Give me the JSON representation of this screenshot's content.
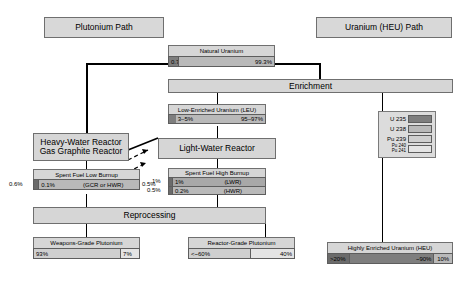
{
  "diagram": {
    "title_plutonium": "Plutonium Path",
    "title_uranium": "Uranium (HEU) Path",
    "nodes": {
      "natural_uranium": {
        "label": "Natural Uranium",
        "segments": [
          {
            "value": "0.7%",
            "isotope": "U 235"
          },
          {
            "value": "99.3%",
            "isotope": "U 238"
          }
        ]
      },
      "enrichment": {
        "label": "Enrichment"
      },
      "leu": {
        "label": "Low-Enriched Uranium (LEU)",
        "segments": [
          {
            "value": "3–5%",
            "isotope": "U 235"
          },
          {
            "value": "95–97%",
            "isotope": "U 238"
          }
        ]
      },
      "heavy_water_reactor": {
        "line1": "Heavy-Water Reactor",
        "line2": "Gas Graphite Reactor"
      },
      "light_water_reactor": {
        "label": "Light-Water Reactor"
      },
      "spent_fuel_low": {
        "label": "Spent Fuel Low Burnup",
        "sublabel": "(GCR or HWR)",
        "outside_left": "0.6%",
        "outside_right": "0.5%",
        "segments": [
          {
            "value": "0.1%",
            "isotope": "U 235"
          }
        ]
      },
      "spent_fuel_high": {
        "label": "Spent Fuel High Burnup",
        "row1_label": "(LWR)",
        "row1_value": "1%",
        "row1_outside": "1%",
        "row2_label": "(HWR)",
        "row2_value": "0.2%",
        "row2_outside": "0.5%"
      },
      "reprocessing": {
        "label": "Reprocessing"
      },
      "weapons_grade_plutonium": {
        "label": "Weapons-Grade Plutonium",
        "segments": [
          {
            "value": "93%",
            "isotope": "Pu 239"
          },
          {
            "value": "7%",
            "isotope": "Pu 240/241"
          }
        ]
      },
      "reactor_grade_plutonium": {
        "label": "Reactor-Grade Plutonium",
        "segments": [
          {
            "value": "<~60%",
            "isotope": "Pu 239"
          },
          {
            "value": "40%",
            "isotope": "Pu 240/241"
          }
        ]
      },
      "heu": {
        "label": "Highly Enriched Uranium (HEU)",
        "segments": [
          {
            "value": ">20%",
            "isotope": "U 235 min"
          },
          {
            "value": "~90%",
            "isotope": "U 235"
          },
          {
            "value": "10%",
            "isotope": "U 238"
          }
        ]
      }
    },
    "legend": {
      "items": [
        {
          "label": "U 235",
          "swatch": "#7e7e7e"
        },
        {
          "label": "U 238",
          "swatch": "#b9b9b9"
        },
        {
          "label": "Pu 239",
          "swatch": "#cfcfcf"
        },
        {
          "label": "Pu 240",
          "label2": "Pu 241",
          "swatch": "#e4e4e4"
        }
      ]
    },
    "colors": {
      "box_fill": "#d6d6d6",
      "border": "#6f6f6f",
      "u235": "#7e7e7e",
      "u238": "#b9b9b9",
      "pu239": "#cfcfcf",
      "pu24x": "#e4e4e4"
    }
  }
}
